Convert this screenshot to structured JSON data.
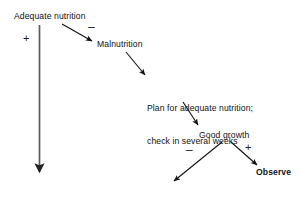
{
  "figure": {
    "type": "flow-diagram",
    "background_color": "#ffffff",
    "ink_color": "#111111",
    "nodes": [
      {
        "id": "adequate_nutrition",
        "label": "Adequate nutrition",
        "bold": false
      },
      {
        "id": "malnutrition",
        "label": "Malnutrition",
        "bold": false
      },
      {
        "id": "plan_line1",
        "label": "Plan for adequate nutrition;",
        "bold": false
      },
      {
        "id": "plan_line2",
        "label": "check in several weeks",
        "bold": false
      },
      {
        "id": "good_growth",
        "label": "Good growth",
        "bold": false
      },
      {
        "id": "observe",
        "label": "Observe",
        "bold": true
      }
    ],
    "signs": [
      {
        "id": "plus_adequate_branch",
        "symbol": "+"
      },
      {
        "id": "minus_to_malnutrition",
        "symbol": "–"
      },
      {
        "id": "minus_from_good_growth",
        "symbol": "–"
      },
      {
        "id": "plus_to_observe",
        "symbol": "+"
      }
    ],
    "edges": [
      {
        "id": "adequate-down",
        "from": "adequate_nutrition",
        "to": "flow-exit",
        "sign": "+",
        "style": "long-vertical"
      },
      {
        "id": "adequate-malnutrition",
        "from": "adequate_nutrition",
        "to": "malnutrition",
        "sign": "–",
        "style": "diagonal"
      },
      {
        "id": "malnutrition-plan",
        "from": "malnutrition",
        "to": "plan",
        "sign": "",
        "style": "diagonal"
      },
      {
        "id": "plan-good-growth",
        "from": "plan",
        "to": "good_growth",
        "sign": "",
        "style": "diagonal"
      },
      {
        "id": "good-growth-no",
        "from": "good_growth",
        "to": "flow-exit",
        "sign": "–",
        "style": "diagonal"
      },
      {
        "id": "good-growth-observe",
        "from": "good_growth",
        "to": "observe",
        "sign": "+",
        "style": "diagonal"
      }
    ]
  }
}
